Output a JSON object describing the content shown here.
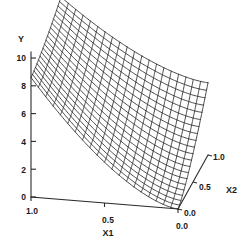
{
  "figure": {
    "kind": "3d-wireframe-surface-plot",
    "background_color": "#ffffff",
    "line_color": "#262626",
    "axis_color": "#2b2b2b",
    "text_color": "#1a1a1a"
  },
  "axes": {
    "y": {
      "title": "Y",
      "ticks": [
        "0",
        "2",
        "4",
        "6",
        "8",
        "10"
      ],
      "tick_values": [
        0,
        2,
        4,
        6,
        8,
        10
      ],
      "range": [
        0,
        10.6
      ]
    },
    "x1": {
      "title": "X1",
      "ticks": [
        "1.0",
        "0.5",
        "0.0"
      ],
      "tick_values": [
        1.0,
        0.5,
        0.0
      ],
      "range": [
        1.0,
        0.0
      ]
    },
    "x2": {
      "title": "X2",
      "ticks": [
        "0.0",
        "0.5",
        "1.0"
      ],
      "tick_values": [
        0.0,
        0.5,
        1.0
      ],
      "range": [
        0.0,
        1.0
      ]
    }
  },
  "chart_data": {
    "type": "surface",
    "title": "",
    "xlabel": "X1",
    "ylabel": "X2",
    "zlabel": "Y",
    "xlim": [
      0,
      1
    ],
    "ylim": [
      0,
      1
    ],
    "zlim": [
      0,
      10.6
    ],
    "grid": false,
    "legend": null,
    "mesh_n": 20,
    "corner_values": {
      "x1_0_x2_0": 0.0,
      "x1_1_x2_0": 8.6,
      "x1_0_x2_1": 5.2,
      "x1_1_x2_1": 10.5
    },
    "surface_formula_note": "Y rises steeply with X1 and moderately with X2; concave top ridge along X1=1",
    "x_ticks": [
      1.0,
      0.5,
      0.0
    ],
    "y_ticks": [
      0.0,
      0.5,
      1.0
    ],
    "z_ticks": [
      0,
      2,
      4,
      6,
      8,
      10
    ]
  },
  "geometry": {
    "origin": [
      31,
      197
    ],
    "front_corner": [
      178,
      209
    ],
    "x2_top_corner": [
      208,
      155
    ],
    "y_axis_top": [
      31,
      52
    ],
    "surface_peak": [
      88,
      12
    ],
    "surface_right": [
      232,
      55
    ],
    "surface_left": [
      33,
      78
    ]
  }
}
